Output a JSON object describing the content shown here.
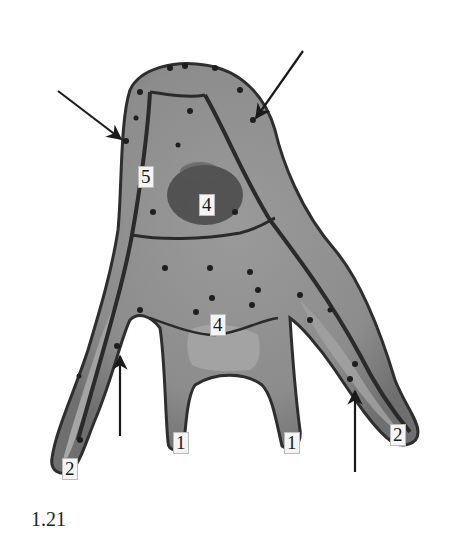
{
  "figure": {
    "number": "1.21",
    "background": "#ffffff",
    "tissue_colors": {
      "light": "#b5b5b5",
      "mid": "#8a8a8a",
      "dark": "#3a3a3a",
      "edge": "#2a2a2a"
    },
    "labels": [
      {
        "id": "label-5",
        "text": "5",
        "x": 138,
        "y": 166
      },
      {
        "id": "label-4-upper",
        "text": "4",
        "x": 199,
        "y": 194
      },
      {
        "id": "label-4-lower",
        "text": "4",
        "x": 210,
        "y": 314
      },
      {
        "id": "label-1-left",
        "text": "1",
        "x": 173,
        "y": 432
      },
      {
        "id": "label-1-right",
        "text": "1",
        "x": 284,
        "y": 432
      },
      {
        "id": "label-2-left",
        "text": "2",
        "x": 62,
        "y": 458
      },
      {
        "id": "label-2-right",
        "text": "2",
        "x": 390,
        "y": 424
      }
    ],
    "arrows": [
      {
        "id": "arrow-upper-left",
        "x1": 58,
        "y1": 91,
        "x2": 121,
        "y2": 139
      },
      {
        "id": "arrow-upper-right",
        "x1": 303,
        "y1": 51,
        "x2": 256,
        "y2": 118
      },
      {
        "id": "arrow-lower-left",
        "x1": 120,
        "y1": 436,
        "x2": 120,
        "y2": 356
      },
      {
        "id": "arrow-lower-right",
        "x1": 355,
        "y1": 472,
        "x2": 355,
        "y2": 391
      }
    ]
  }
}
